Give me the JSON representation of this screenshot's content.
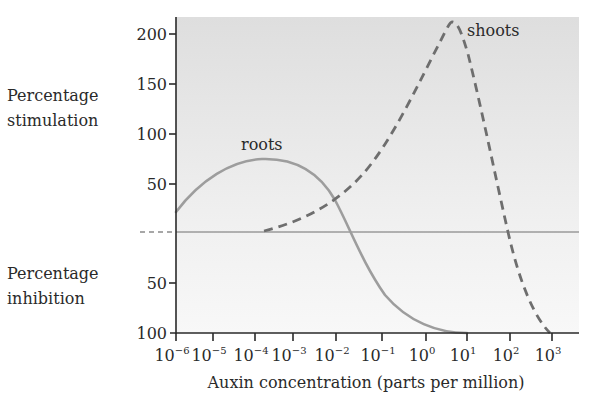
{
  "chart_data": {
    "type": "line",
    "title": "",
    "xlabel": "Auxin concentration (parts per million)",
    "ylabel_upper": [
      "Percentage",
      "stimulation"
    ],
    "ylabel_lower": [
      "Percentage",
      "inhibition"
    ],
    "x_scale": "log10",
    "x_tick_exponents": [
      -6,
      -5,
      -4,
      -3,
      -2,
      -1,
      0,
      1,
      2,
      3
    ],
    "x_tick_base": "10",
    "y_ticks_upper": [
      "200",
      "150",
      "100",
      "50"
    ],
    "y_ticks_lower": [
      "50",
      "100"
    ],
    "ylim": [
      -100,
      220
    ],
    "grid": false,
    "series": [
      {
        "name": "roots",
        "style": "solid",
        "color": "#9a9a9a",
        "x_log10": [
          -6,
          -5,
          -4.5,
          -4,
          -3.5,
          -3,
          -2.5,
          -2,
          -1.6,
          -1,
          0,
          0.5,
          1
        ],
        "values": [
          21,
          50,
          66,
          74,
          73,
          62,
          38,
          16,
          -10,
          -50,
          -88,
          -97,
          -100
        ]
      },
      {
        "name": "shoots",
        "style": "dashed",
        "color": "#6a6a6a",
        "x_log10": [
          -4,
          -3,
          -2,
          -1,
          0,
          0.5,
          0.7,
          1,
          1.5,
          2,
          2.5,
          3
        ],
        "values": [
          2,
          15,
          38,
          85,
          160,
          205,
          210,
          185,
          95,
          0,
          -70,
          -100
        ]
      }
    ],
    "annotations": [
      "roots",
      "shoots"
    ]
  },
  "labels": {
    "roots": "roots",
    "shoots": "shoots",
    "xlabel": "Auxin concentration (parts per million)",
    "stim1": "Percentage",
    "stim2": "stimulation",
    "inh1": "Percentage",
    "inh2": "inhibition"
  },
  "colors": {
    "bg_top": "#e2e2e2",
    "bg_bottom": "#f7f7f7",
    "axis": "#2a2a2a",
    "zero_line": "#9a9a9a",
    "roots": "#9a9a9a",
    "shoots": "#6a6a6a"
  }
}
